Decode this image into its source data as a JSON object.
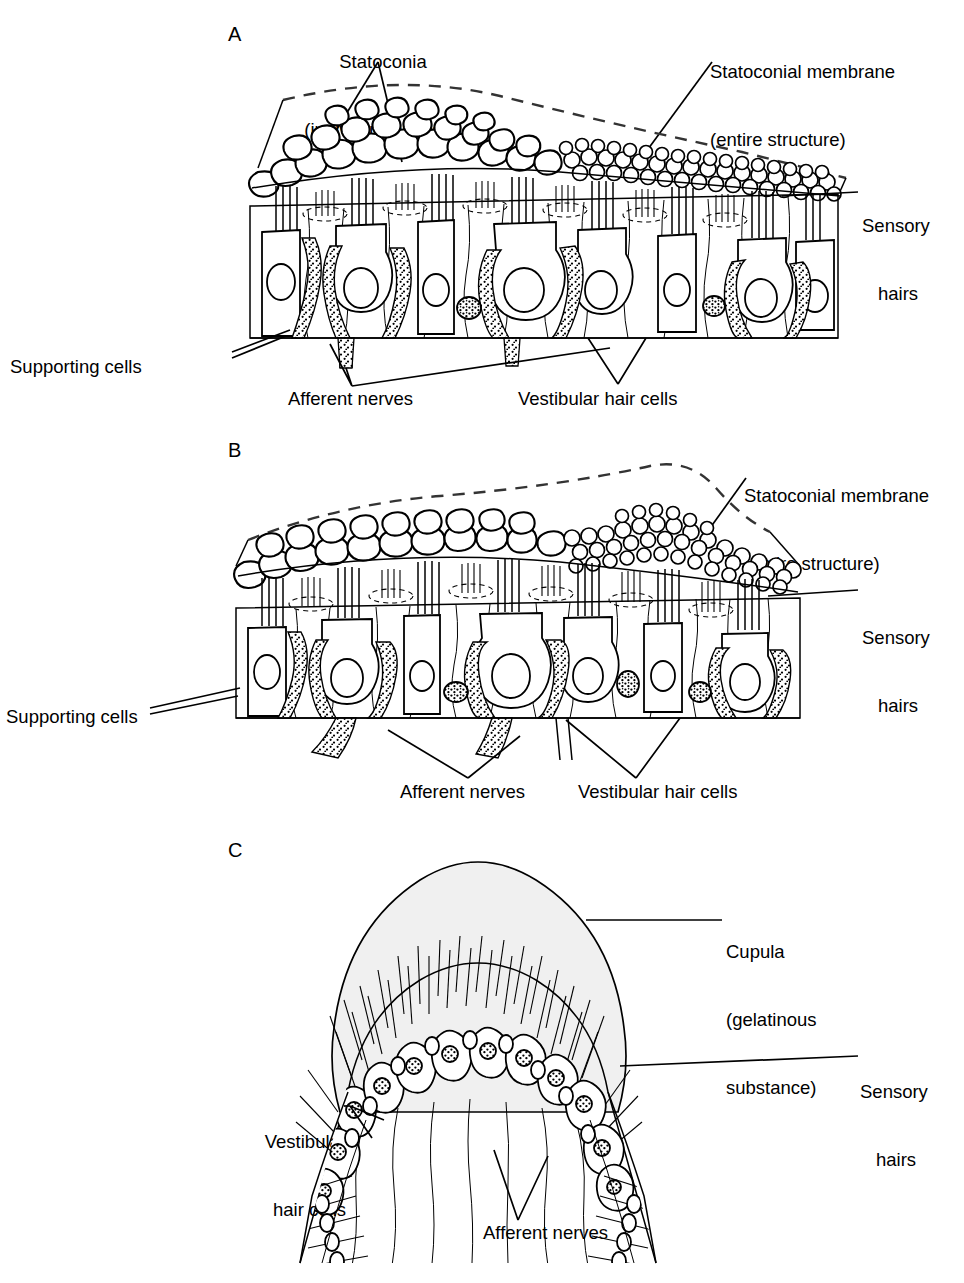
{
  "figure": {
    "background_color": "#ffffff",
    "ink_color": "#000000",
    "cupula_fill": "#f0f0f0",
    "panels": [
      {
        "id": "A",
        "letter": "A",
        "name": "macula-horizontal",
        "labels": [
          {
            "name": "statoconia",
            "lines": [
              "Statoconia",
              "(individual crystals)"
            ],
            "align": "center"
          },
          {
            "name": "statoconial-membrane",
            "lines": [
              "Statoconial membrane",
              "(entire structure)"
            ],
            "align": "left"
          },
          {
            "name": "sensory-hairs",
            "lines": [
              "Sensory",
              "hairs"
            ],
            "align": "left"
          },
          {
            "name": "supporting-cells",
            "lines": [
              "Supporting cells"
            ],
            "align": "left"
          },
          {
            "name": "afferent-nerves",
            "lines": [
              "Afferent nerves"
            ],
            "align": "center"
          },
          {
            "name": "vestibular-hair-cells",
            "lines": [
              "Vestibular hair cells"
            ],
            "align": "center"
          }
        ]
      },
      {
        "id": "B",
        "letter": "B",
        "name": "macula-tilted",
        "labels": [
          {
            "name": "statoconial-membrane",
            "lines": [
              "Statoconial membrane",
              "(entire structure)"
            ],
            "align": "left"
          },
          {
            "name": "sensory-hairs",
            "lines": [
              "Sensory",
              "hairs"
            ],
            "align": "left"
          },
          {
            "name": "supporting-cells",
            "lines": [
              "Supporting cells"
            ],
            "align": "left"
          },
          {
            "name": "afferent-nerves",
            "lines": [
              "Afferent nerves"
            ],
            "align": "center"
          },
          {
            "name": "vestibular-hair-cells",
            "lines": [
              "Vestibular hair cells"
            ],
            "align": "center"
          }
        ]
      },
      {
        "id": "C",
        "letter": "C",
        "name": "crista-ampullaris",
        "labels": [
          {
            "name": "cupula",
            "lines": [
              "Cupula",
              "(gelatinous",
              "substance)"
            ],
            "align": "left"
          },
          {
            "name": "sensory-hairs",
            "lines": [
              "Sensory",
              "hairs"
            ],
            "align": "left"
          },
          {
            "name": "vestibular-hair-cells",
            "lines": [
              "Vestibular",
              "hair cells"
            ],
            "align": "left"
          },
          {
            "name": "afferent-nerves",
            "lines": [
              "Afferent nerves"
            ],
            "align": "center"
          }
        ]
      }
    ]
  },
  "text": {
    "panelA_letter": "A",
    "panelB_letter": "B",
    "panelC_letter": "C",
    "statoconia_l1": "Statoconia",
    "statoconia_l2": "(individual crystals)",
    "statoconial_membrane_l1": "Statoconial membrane",
    "statoconial_membrane_l2": "(entire structure)",
    "sensory_l1": "Sensory",
    "sensory_l2": "hairs",
    "supporting_cells": "Supporting cells",
    "afferent_nerves": "Afferent nerves",
    "vestibular_hair_cells": "Vestibular hair cells",
    "cupula_l1": "Cupula",
    "cupula_l2": "(gelatinous",
    "cupula_l3": "substance)",
    "vhc_l1": "Vestibular",
    "vhc_l2": "hair cells"
  }
}
